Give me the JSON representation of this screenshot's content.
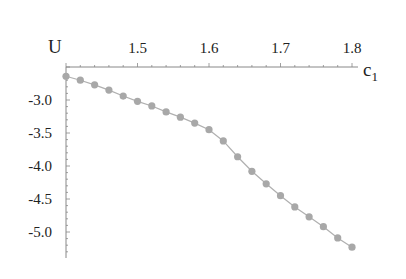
{
  "chart_data": {
    "type": "line",
    "title": "",
    "xlabel": "c",
    "xlabel_subscript": "1",
    "ylabel": "U",
    "xlim": [
      1.4,
      1.81
    ],
    "ylim": [
      -5.3,
      -2.5
    ],
    "axes_origin": [
      1.4,
      -2.5
    ],
    "x_ticks": [
      1.5,
      1.6,
      1.7,
      1.8
    ],
    "x_tick_labels": [
      "1.5",
      "1.6",
      "1.7",
      "1.8"
    ],
    "y_ticks": [
      -3.0,
      -3.5,
      -4.0,
      -4.5,
      -5.0
    ],
    "y_tick_labels": [
      "-3.0",
      "-3.5",
      "-4.0",
      "-4.5",
      "-5.0"
    ],
    "grid": false,
    "legend": null,
    "series": [
      {
        "name": "U(c1)",
        "marker": "circle",
        "color": "#a8a8a8",
        "x": [
          1.4,
          1.42,
          1.44,
          1.46,
          1.48,
          1.5,
          1.52,
          1.54,
          1.56,
          1.58,
          1.6,
          1.62,
          1.64,
          1.66,
          1.68,
          1.7,
          1.72,
          1.74,
          1.76,
          1.78,
          1.8
        ],
        "y": [
          -2.64,
          -2.7,
          -2.77,
          -2.85,
          -2.94,
          -3.02,
          -3.09,
          -3.18,
          -3.26,
          -3.35,
          -3.45,
          -3.62,
          -3.86,
          -4.08,
          -4.27,
          -4.45,
          -4.62,
          -4.77,
          -4.92,
          -5.09,
          -5.23
        ]
      }
    ]
  },
  "colors": {
    "axis": "#888888",
    "line": "#b0b0b0",
    "marker": "#a8a8a8",
    "text": "#222222"
  }
}
